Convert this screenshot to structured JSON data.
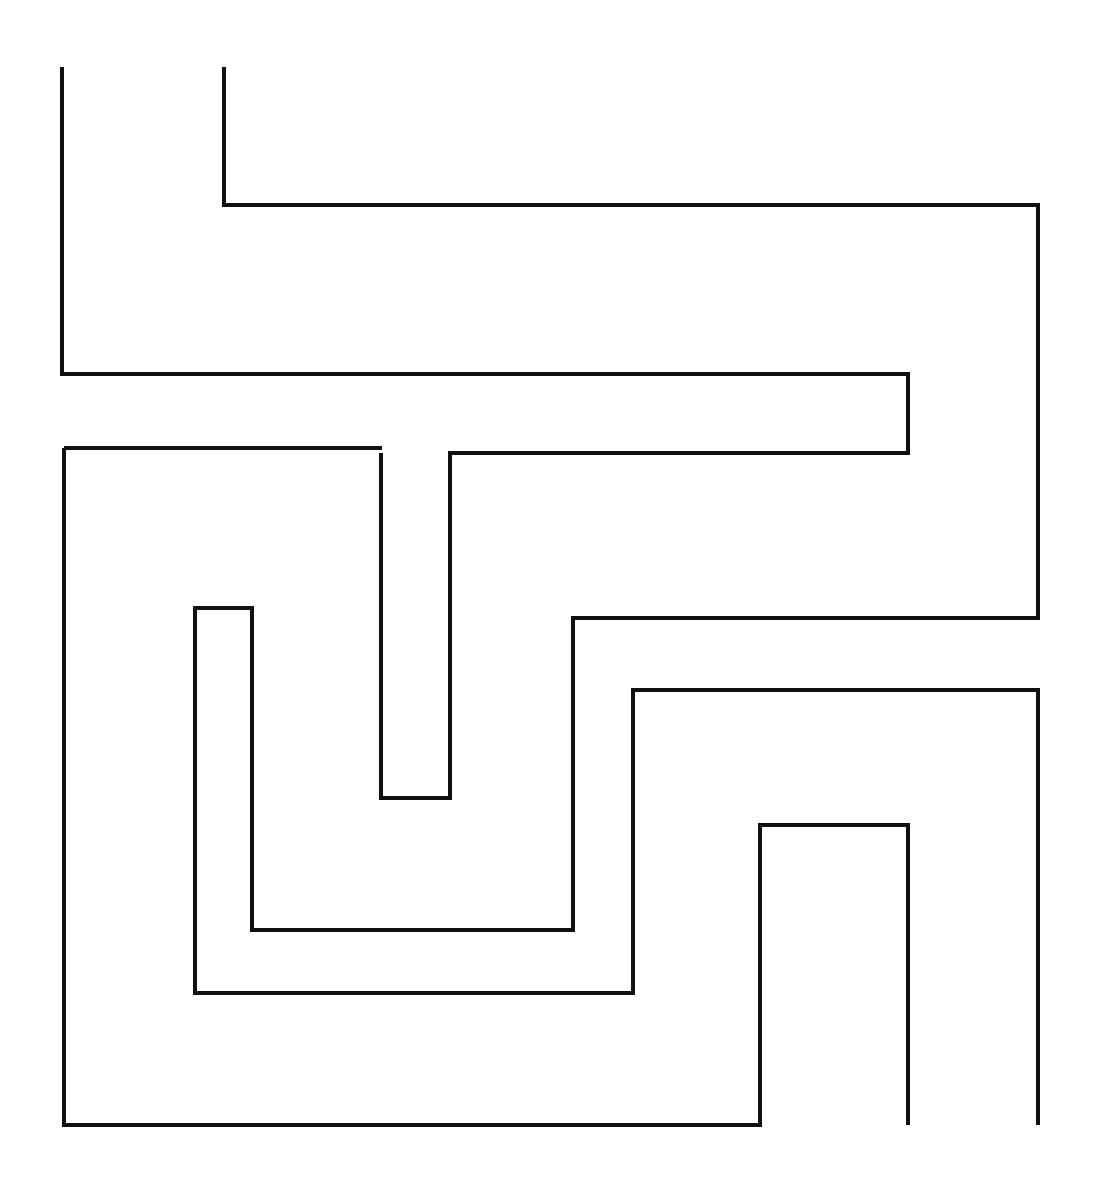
{
  "figure": {
    "canvas": {
      "width": 1101,
      "height": 1191,
      "background_color": "#ffffff"
    },
    "style": {
      "stroke_color": "#111111",
      "stroke_width": 4,
      "fill": "none",
      "line_join": "miter",
      "line_cap": "butt"
    },
    "paths": [
      {
        "name": "path-outer-left-hook",
        "label": "Outer left hook with long U channel",
        "points": "62,67 62,374 908,374 908,453 450,453 450,798 381,798 381,453"
      },
      {
        "name": "path-spiral-main",
        "label": "Main inward spiral from top second stem",
        "points": "224,67 224,205 1038,205 1038,618 573,618 573,930 252,930 252,608 195,608 195,993 633,993 633,690 1038,690 1038,1125"
      },
      {
        "name": "path-outer-frame-bottom",
        "label": "Outer frame left wall and bottom run",
        "points": "64,448 382,448"
      },
      {
        "name": "path-outer-frame-left",
        "label": "Outer left wall down to bottom and right to inner tower",
        "points": "64,448 64,1125 760,1125 760,825 908,825 908,1125"
      }
    ]
  }
}
